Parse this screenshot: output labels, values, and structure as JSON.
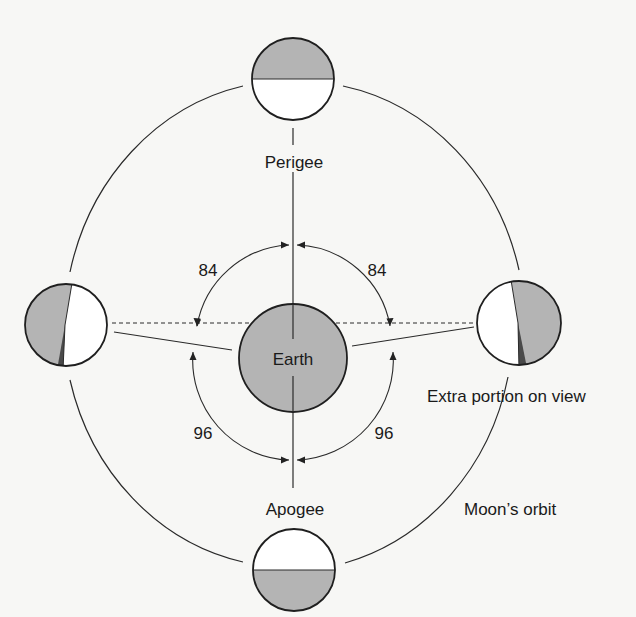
{
  "diagram": {
    "center_label": "Earth",
    "labels": {
      "perigee": "Perigee",
      "apogee": "Apogee",
      "extra_portion": "Extra portion on view",
      "orbit": "Moon’s orbit"
    },
    "angles": {
      "top_left": "84",
      "top_right": "84",
      "bottom_left": "96",
      "bottom_right": "96"
    },
    "colors": {
      "shade": "#b4b4b4",
      "dark_wedge": "#4a4a4a",
      "line": "#2a2a2a",
      "background": "#f7f7f5"
    },
    "moons": [
      {
        "position": "top",
        "shaded_half": "upper"
      },
      {
        "position": "bottom",
        "shaded_half": "lower"
      },
      {
        "position": "left",
        "shaded_half": "left",
        "extra_wedge": true
      },
      {
        "position": "right",
        "shaded_half": "right",
        "extra_wedge": true
      }
    ]
  }
}
